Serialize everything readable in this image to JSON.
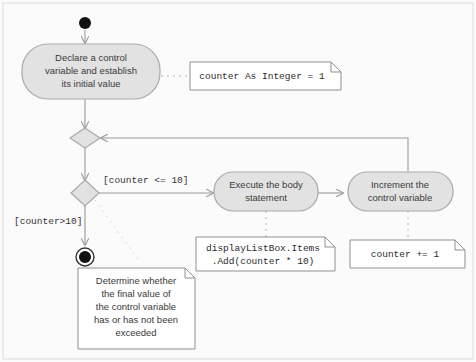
{
  "diagram": {
    "colors": {
      "canvas_background": "#fbfbfb",
      "canvas_border": "#e3e3e3",
      "node_fill": "#e2e2e2",
      "node_stroke": "#a9a9a9",
      "note_fill": "#ffffff",
      "note_stroke": "#8f8f8f",
      "edge_stroke": "#9a9a9a",
      "marker_fill": "#111111",
      "text_color": "#3a3a3a"
    },
    "start_node": {
      "label": "initial-node"
    },
    "final_node": {
      "label": "activity-final-node"
    },
    "activities": [
      {
        "id": "declare",
        "lines": [
          "Declare a control",
          "variable and establish",
          "its initial value"
        ]
      },
      {
        "id": "execute",
        "lines": [
          "Execute the body",
          "statement"
        ]
      },
      {
        "id": "increment",
        "lines": [
          "Increment the",
          "control variable"
        ]
      }
    ],
    "decisions": [
      {
        "id": "merge",
        "label": "merge-node"
      },
      {
        "id": "decision",
        "label": "decision-node"
      }
    ],
    "guards": [
      {
        "id": "guard-true",
        "text": "[counter  <= 10]"
      },
      {
        "id": "guard-false",
        "text": "[counter>10]"
      }
    ],
    "notes": [
      {
        "id": "note-declare",
        "lines": [
          "counter As Integer = 1"
        ]
      },
      {
        "id": "note-execute",
        "lines": [
          "displayListBox.Items",
          " .Add(counter * 10)"
        ]
      },
      {
        "id": "note-increment",
        "lines": [
          "counter += 1"
        ]
      },
      {
        "id": "note-final",
        "lines": [
          "Determine whether",
          "the final value of",
          "the control variable",
          "has or has not been",
          "exceeded"
        ]
      }
    ]
  }
}
